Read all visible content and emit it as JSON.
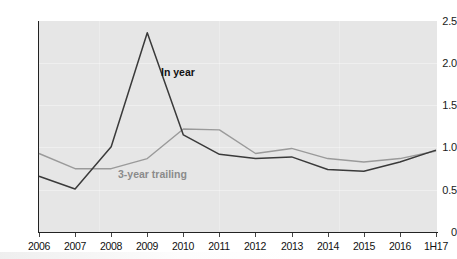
{
  "chart_data": {
    "type": "line",
    "title": "",
    "subtitle": "",
    "xlabel": "",
    "ylabel": "",
    "categories": [
      "2006",
      "2007",
      "2008",
      "2009",
      "2010",
      "2011",
      "2012",
      "2013",
      "2014",
      "2015",
      "2016",
      "1H17"
    ],
    "ylim": [
      0,
      2.5
    ],
    "xlim_labels": [
      "2006",
      "1H17"
    ],
    "yticks": [
      "0",
      "0.5",
      "1.0",
      "1.5",
      "2.0",
      "2.5"
    ],
    "ytick_values": [
      0,
      0.5,
      1.0,
      1.5,
      2.0,
      2.5
    ],
    "grid": true,
    "legend_position": "inline-annotations",
    "series": [
      {
        "name": "In year",
        "color": "#3a3a3a",
        "values": [
          0.66,
          0.51,
          1.01,
          2.36,
          1.15,
          0.92,
          0.87,
          0.89,
          0.74,
          0.72,
          0.83,
          0.97
        ]
      },
      {
        "name": "3-year trailing",
        "color": "#9a9a9a",
        "values": [
          0.93,
          0.75,
          0.75,
          0.87,
          1.22,
          1.21,
          0.93,
          0.99,
          0.87,
          0.83,
          0.87,
          0.96
        ]
      }
    ],
    "annotations": [
      {
        "text": "In year",
        "series": "In year",
        "bold": true,
        "color": "#111111"
      },
      {
        "text": "3-year trailing",
        "series": "3-year trailing",
        "bold": true,
        "color": "#8b8b8b"
      }
    ]
  },
  "colors": {
    "plot_background": "#e6e6e6",
    "page_background": "#ffffff",
    "axis": "#222222",
    "gridline": "#efefef",
    "series_in_year": "#3a3a3a",
    "series_trailing": "#9a9a9a",
    "tick_label": "#111111"
  }
}
